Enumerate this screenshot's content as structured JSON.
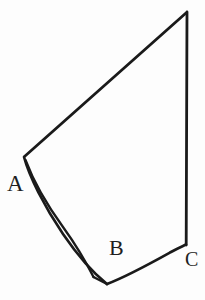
{
  "figure": {
    "type": "line-drawing",
    "background_color": "#fdfdfd",
    "stroke_color": "#1a1a1a",
    "stroke_width": 2.6,
    "width": 205,
    "height": 300,
    "labels": [
      {
        "id": "A",
        "text": "A",
        "x": 7,
        "y": 172,
        "font_size": 23
      },
      {
        "id": "B",
        "text": "B",
        "x": 109,
        "y": 237,
        "font_size": 22
      },
      {
        "id": "C",
        "text": "C",
        "x": 185,
        "y": 249,
        "font_size": 20
      }
    ],
    "vertices": {
      "apex_top": [
        186,
        12
      ],
      "A": [
        24,
        157
      ],
      "notch_bottom": [
        107,
        284
      ],
      "C": [
        186,
        244
      ]
    },
    "paths": {
      "upper_diagonal": "M 186 13 L 24.5 156.5",
      "right_vertical": "M 187 12 L 186.2 245",
      "outer_curve_A_to_notch": "M 24 157 C 29 176 44 206 63 234 C 78 256 92 272 107 284",
      "inner_curve_A_to_notch": "M 25.5 160 C 33 180 47 205 63 227 C 76 245 86 262 93.5 277",
      "notch_tip": "M 93.5 277 L 107 284",
      "lower_curve_notch_to_C": "M 107 284 C 128 276 153 262 171 252 C 178 248 183 246 186 244.5"
    },
    "caption_fragment": "  "
  }
}
